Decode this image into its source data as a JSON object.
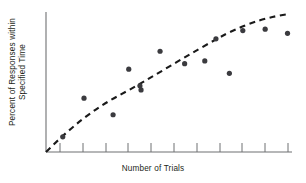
{
  "chart_data": {
    "type": "scatter",
    "title": "",
    "xlabel": "Number of Trials",
    "ylabel_line1": "Percent of Responses within",
    "ylabel_line2": "Specified Time",
    "grid": false,
    "legend": false,
    "axis_tick_labels_x": [],
    "axis_tick_labels_y": [],
    "xlim": [
      0,
      11
    ],
    "ylim": [
      0,
      100
    ],
    "x_tick_count": 11,
    "series": [
      {
        "name": "Observed responses",
        "marker": "filled-circle",
        "color": "#3b3b3f",
        "points": [
          {
            "x": 0.75,
            "y": 11
          },
          {
            "x": 1.7,
            "y": 39
          },
          {
            "x": 3.0,
            "y": 27
          },
          {
            "x": 3.7,
            "y": 60
          },
          {
            "x": 4.2,
            "y": 48
          },
          {
            "x": 4.25,
            "y": 45
          },
          {
            "x": 5.1,
            "y": 73
          },
          {
            "x": 6.2,
            "y": 64
          },
          {
            "x": 7.1,
            "y": 66
          },
          {
            "x": 7.6,
            "y": 82
          },
          {
            "x": 8.2,
            "y": 57
          },
          {
            "x": 8.8,
            "y": 88
          },
          {
            "x": 9.8,
            "y": 89
          },
          {
            "x": 10.8,
            "y": 86
          }
        ]
      }
    ],
    "trendline": {
      "name": "Fitted learning curve",
      "style": "dashed",
      "color": "#1a1a1a",
      "shape": "negatively-accelerated-increasing",
      "points": [
        {
          "x": 0.0,
          "y": 0
        },
        {
          "x": 0.5,
          "y": 14
        },
        {
          "x": 1.0,
          "y": 26
        },
        {
          "x": 1.6,
          "y": 36
        },
        {
          "x": 2.2,
          "y": 45
        },
        {
          "x": 3.0,
          "y": 54
        },
        {
          "x": 4.0,
          "y": 63
        },
        {
          "x": 5.0,
          "y": 70
        },
        {
          "x": 6.0,
          "y": 76
        },
        {
          "x": 7.0,
          "y": 81
        },
        {
          "x": 8.0,
          "y": 86
        },
        {
          "x": 9.0,
          "y": 90
        },
        {
          "x": 10.0,
          "y": 94
        },
        {
          "x": 11.0,
          "y": 97
        }
      ]
    },
    "axis_color": "#6f7072",
    "marker_color": "#3b3b3f",
    "trendline_color": "#1a1a1a"
  }
}
